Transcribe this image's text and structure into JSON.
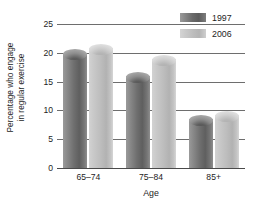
{
  "chart_data": {
    "type": "bar",
    "title": "",
    "categories": [
      "65–74",
      "75–84",
      "85+"
    ],
    "series": [
      {
        "name": "1997",
        "values": [
          20,
          16,
          8.5
        ],
        "color": "#6f6f6f"
      },
      {
        "name": "2006",
        "values": [
          20.8,
          19,
          9.2
        ],
        "color": "#c4c4c4"
      }
    ],
    "xlabel": "Age",
    "ylabel_line1": "Percentage who engage",
    "ylabel_line2": "in regular exercise",
    "ylim": [
      0,
      25
    ],
    "yticks": [
      0,
      5,
      10,
      15,
      20,
      25
    ],
    "ytick_labels": [
      "0",
      "5",
      "10",
      "15",
      "20",
      "25"
    ],
    "grid": true,
    "legend_position": "top-right"
  },
  "legend": {
    "items": [
      {
        "label": "1997",
        "swatch": "dark-gray-swatch"
      },
      {
        "label": "2006",
        "swatch": "light-gray-swatch"
      }
    ]
  }
}
